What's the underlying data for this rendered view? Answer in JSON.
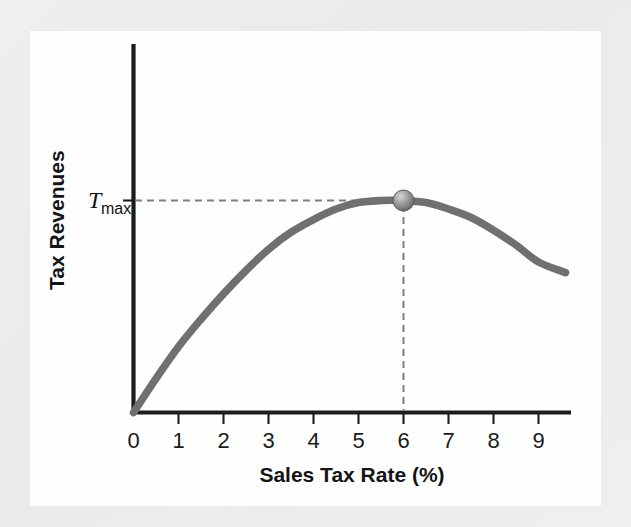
{
  "figure": {
    "kind": "economics-diagram",
    "name": "Laffer curve diagram",
    "background_color": "#ececec",
    "panel_color": "#fefefe"
  },
  "labels": {
    "y_axis_title": "Tax Revenues",
    "x_axis_title": "Sales Tax Rate (%)",
    "tmax_symbol": "T",
    "tmax_subscript": "max"
  },
  "chart_data": {
    "type": "line",
    "title": "",
    "subtitle": "",
    "xlabel": "Sales Tax Rate (%)",
    "ylabel": "Tax Revenues",
    "xlim": [
      0,
      9.75
    ],
    "ylim": [
      0,
      1.18
    ],
    "grid": false,
    "legend": null,
    "x_ticks": [
      0,
      1,
      2,
      3,
      4,
      5,
      6,
      7,
      8,
      9
    ],
    "x_tick_labels": [
      "0",
      "1",
      "2",
      "3",
      "4",
      "5",
      "6",
      "7",
      "8",
      "9"
    ],
    "y_ticks": [
      1.0
    ],
    "y_tick_labels": [
      "Tmax"
    ],
    "series": [
      {
        "name": "Tax revenue curve",
        "x": [
          0,
          0.5,
          1,
          1.5,
          2,
          2.5,
          3,
          3.5,
          4,
          4.5,
          5,
          5.5,
          6,
          6.5,
          7,
          7.5,
          8,
          8.5,
          9,
          9.6
        ],
        "y": [
          0.0,
          0.16,
          0.31,
          0.44,
          0.56,
          0.67,
          0.77,
          0.85,
          0.91,
          0.96,
          0.99,
          1.0,
          1.0,
          0.99,
          0.96,
          0.92,
          0.86,
          0.79,
          0.71,
          0.66
        ]
      }
    ],
    "annotations": [
      {
        "name": "revenue-maximizing-point",
        "label": "Tmax",
        "x": 6,
        "y": 1.0,
        "marker": "sphere",
        "marker_color": "#8b8c8d",
        "guides": [
          "horizontal-dashed-to-y-axis",
          "vertical-dashed-to-x-axis"
        ]
      }
    ],
    "colors": {
      "curve": "#6f7071",
      "axis": "#1c1c1c",
      "guide": "#7d7e7f",
      "marker": "#8b8c8d",
      "text": "#141414"
    }
  }
}
